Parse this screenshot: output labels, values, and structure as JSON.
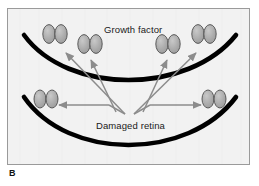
{
  "figure": {
    "panel_letter": "B",
    "labels": {
      "growth_factor": "Growth factor",
      "damaged_retina": "Damaged retina"
    },
    "colors": {
      "background": "#f2f2f2",
      "frame_border": "#9a9a9a",
      "arc": "#000000",
      "cell_fill": "#a8a8a8",
      "cell_stroke": "#4d4d4d",
      "arrow": "#8c8c8c",
      "text": "#1a1a1a"
    },
    "arcs": [
      {
        "name": "upper-retina-arc",
        "path": "M 16 26 C 60 86, 180 86, 228 26"
      },
      {
        "name": "lower-retina-arc",
        "path": "M 16 88 C 60 152, 180 152, 228 88"
      }
    ],
    "cell_clusters": [
      {
        "name": "cell-cluster-upper-left",
        "cx": 47,
        "cy": 25
      },
      {
        "name": "cell-cluster-upper-midleft",
        "cx": 82,
        "cy": 35
      },
      {
        "name": "cell-cluster-upper-midright",
        "cx": 160,
        "cy": 35
      },
      {
        "name": "cell-cluster-upper-right",
        "cx": 196,
        "cy": 25
      },
      {
        "name": "cell-cluster-lower-left",
        "cx": 38,
        "cy": 90
      },
      {
        "name": "cell-cluster-lower-right",
        "cx": 206,
        "cy": 90
      }
    ],
    "arrows": [
      {
        "name": "arrow-to-upper-left",
        "x1": 117,
        "y1": 105,
        "x2": 58,
        "y2": 44
      },
      {
        "name": "arrow-to-upper-midleft",
        "x1": 108,
        "y1": 103,
        "x2": 83,
        "y2": 51
      },
      {
        "name": "arrow-to-upper-midright",
        "x1": 135,
        "y1": 103,
        "x2": 159,
        "y2": 51
      },
      {
        "name": "arrow-to-upper-right",
        "x1": 126,
        "y1": 105,
        "x2": 188,
        "y2": 44
      },
      {
        "name": "arrow-to-lower-left",
        "x1": 101,
        "y1": 96,
        "x2": 51,
        "y2": 96
      },
      {
        "name": "arrow-to-lower-right",
        "x1": 142,
        "y1": 96,
        "x2": 193,
        "y2": 96
      }
    ],
    "arrow_elbows": [
      {
        "name": "elbow-lower-left",
        "path": "M 117 105 L 101 96"
      },
      {
        "name": "elbow-lower-right",
        "path": "M 126 105 L 142 96"
      }
    ]
  }
}
